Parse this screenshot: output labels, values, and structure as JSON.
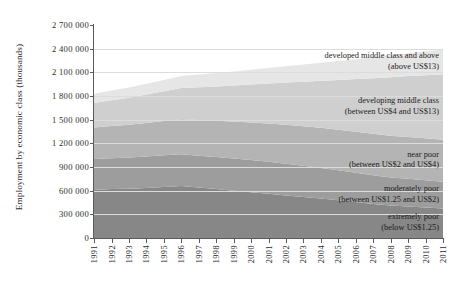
{
  "chart_data": {
    "type": "area",
    "stacked": true,
    "title": "",
    "subtitle": "",
    "xlabel": "",
    "ylabel": "Employment by economic class (thousands)",
    "legend_position": "in-plot-right",
    "grid": true,
    "xlim": [
      1991,
      2011
    ],
    "ylim": [
      0,
      2700000
    ],
    "ytick_step": 300000,
    "ytick_labels": [
      "2 700 000",
      "2 400 000",
      "2 100 000",
      "1 800 000",
      "1 500 000",
      "1 200 000",
      "900 000",
      "600 000",
      "300 000",
      "0"
    ],
    "ytick_values": [
      2700000,
      2400000,
      2100000,
      1800000,
      1500000,
      1200000,
      900000,
      600000,
      300000,
      0
    ],
    "categories": [
      "1991",
      "1992",
      "1993",
      "1994",
      "1995",
      "1996",
      "1997",
      "1998",
      "1999",
      "2000",
      "2001",
      "2002",
      "2003",
      "2004",
      "2005",
      "2006",
      "2007",
      "2008",
      "2009",
      "2010",
      "2011"
    ],
    "series": [
      {
        "name": "extremely poor",
        "label_line1": "extremely poor",
        "label_line2": "(below US$1.25)",
        "threshold": "below US$1.25",
        "color": "#878787",
        "values": [
          610000,
          620000,
          625000,
          635000,
          648000,
          660000,
          640000,
          620000,
          600000,
          580000,
          560000,
          540000,
          520000,
          500000,
          478000,
          455000,
          432000,
          412000,
          400000,
          388000,
          375000
        ]
      },
      {
        "name": "moderately poor",
        "label_line1": "moderately poor",
        "label_line2": "(between US$1.25 and US$2)",
        "threshold": "between US$1.25 and US$2",
        "color": "#9d9d9d",
        "values": [
          390000,
          392000,
          395000,
          398000,
          400000,
          402000,
          404000,
          406000,
          408000,
          408000,
          406000,
          402000,
          396000,
          388000,
          380000,
          372000,
          364000,
          356000,
          350000,
          344000,
          338000
        ]
      },
      {
        "name": "near poor",
        "label_line1": "near poor",
        "label_line2": "(between US$2 and US$4)",
        "threshold": "between US$2 and US$4",
        "color": "#b4b4b4",
        "values": [
          400000,
          408000,
          416000,
          425000,
          434000,
          443000,
          452000,
          460000,
          468000,
          476000,
          484000,
          492000,
          500000,
          508000,
          514000,
          520000,
          524000,
          528000,
          530000,
          532000,
          534000
        ]
      },
      {
        "name": "developing middle class",
        "label_line1": "developing middle class",
        "label_line2": "(between US$4 and US$13)",
        "threshold": "between US$4 and US$13",
        "color": "#cfcfcf",
        "values": [
          310000,
          325000,
          342000,
          360000,
          378000,
          396000,
          416000,
          436000,
          458000,
          482000,
          508000,
          536000,
          566000,
          598000,
          632000,
          668000,
          706000,
          742000,
          772000,
          800000,
          828000
        ]
      },
      {
        "name": "developed middle class and above",
        "label_line1": "developed middle class and above",
        "label_line2": "(above US$13)",
        "threshold": "above US$13",
        "color": "#e6e6e6",
        "values": [
          118000,
          124000,
          130000,
          137000,
          144000,
          152000,
          160000,
          168000,
          177000,
          186000,
          196000,
          206000,
          217000,
          228000,
          240000,
          252000,
          265000,
          278000,
          290000,
          303000,
          316000
        ]
      }
    ],
    "annotations": [
      {
        "series": "developed middle class and above",
        "line1": "developed middle class and above",
        "line2": "(above US$13)"
      },
      {
        "series": "developing middle class",
        "line1": "developing middle class",
        "line2": "(between US$4 and US$13)"
      },
      {
        "series": "near poor",
        "line1": "near poor",
        "line2": "(between US$2 and US$4)"
      },
      {
        "series": "moderately poor",
        "line1": "moderately poor",
        "line2": "(between US$1.25 and US$2)"
      },
      {
        "series": "extremely poor",
        "line1": "extremely poor",
        "line2": "(below US$1.25)"
      }
    ]
  },
  "colors": {
    "axis": "#5a5a5a",
    "grid": "#dcdcdc",
    "text": "#1c1c1c",
    "background": "#ffffff"
  }
}
